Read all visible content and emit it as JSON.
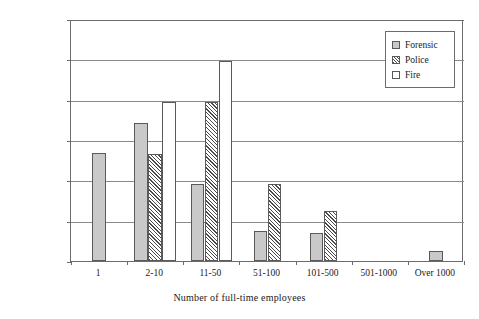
{
  "chart_data": {
    "type": "bar",
    "title": "",
    "xlabel": "Number of full-time employees",
    "ylabel": "Percentage of organizations",
    "categories": [
      "1",
      "2-10",
      "11-50",
      "51-100",
      "101-500",
      "501-1000",
      "Over 1000"
    ],
    "series": [
      {
        "name": "Forensic",
        "values": [
          26.8,
          34.2,
          19.0,
          7.5,
          7.0,
          0,
          2.5
        ],
        "fill": "#c9c9c9",
        "pattern": "solid-gray"
      },
      {
        "name": "Police",
        "values": [
          0,
          26.5,
          39.5,
          19.0,
          12.5,
          0,
          0
        ],
        "fill": "#ffffff",
        "pattern": "diagonal-hatch"
      },
      {
        "name": "Fire",
        "values": [
          0,
          39.5,
          49.5,
          0,
          0,
          0,
          0
        ],
        "fill": "#ffffff",
        "pattern": "empty"
      }
    ],
    "ylim": [
      0,
      60
    ],
    "yticks": [
      "0%",
      "10%",
      "20%",
      "30%",
      "40%",
      "50%",
      "60%"
    ],
    "ytick_values": [
      0,
      10,
      20,
      30,
      40,
      50,
      60
    ],
    "grid": "horizontal",
    "legend_position": "top-right",
    "legend_entries": [
      "Forensic",
      "Police",
      "Fire"
    ]
  },
  "colors": {
    "forensic_fill": "#c9c9c9",
    "hatch_stroke": "#4a4a4a",
    "axis": "#6b6b6b",
    "gridline": "#8a8a8a",
    "text": "#1a1a1a",
    "background": "#ffffff"
  }
}
